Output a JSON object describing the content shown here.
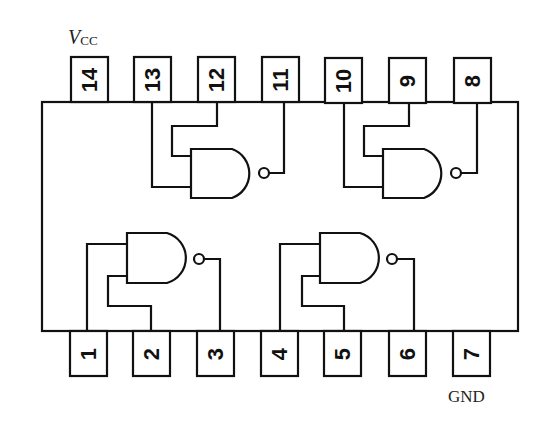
{
  "diagram": {
    "labels": {
      "vcc_main": "V",
      "vcc_sub": "CC",
      "gnd": "GND"
    },
    "pins_top": [
      {
        "number": "14",
        "role": "Vcc"
      },
      {
        "number": "13",
        "role": "gate4 input A"
      },
      {
        "number": "12",
        "role": "gate4 input B"
      },
      {
        "number": "11",
        "role": "gate4 output"
      },
      {
        "number": "10",
        "role": "gate3 input A"
      },
      {
        "number": "9",
        "role": "gate3 input B"
      },
      {
        "number": "8",
        "role": "gate3 output"
      }
    ],
    "pins_bottom": [
      {
        "number": "1",
        "role": "gate1 input A"
      },
      {
        "number": "2",
        "role": "gate1 input B"
      },
      {
        "number": "3",
        "role": "gate1 output"
      },
      {
        "number": "4",
        "role": "gate2 input A"
      },
      {
        "number": "5",
        "role": "gate2 input B"
      },
      {
        "number": "6",
        "role": "gate2 output"
      },
      {
        "number": "7",
        "role": "GND"
      }
    ],
    "gates": [
      {
        "id": "gate1",
        "type": "NAND",
        "inputs": [
          "1",
          "2"
        ],
        "output": "3"
      },
      {
        "id": "gate2",
        "type": "NAND",
        "inputs": [
          "4",
          "5"
        ],
        "output": "6"
      },
      {
        "id": "gate3",
        "type": "NAND",
        "inputs": [
          "10",
          "9"
        ],
        "output": "8"
      },
      {
        "id": "gate4",
        "type": "NAND",
        "inputs": [
          "13",
          "12"
        ],
        "output": "11"
      }
    ],
    "colors": {
      "stroke": "#111111",
      "background": "#ffffff"
    }
  }
}
